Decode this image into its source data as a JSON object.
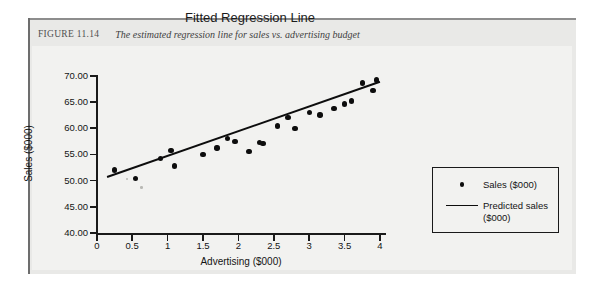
{
  "figure": {
    "label": "FIGURE 11.14",
    "caption": "The estimated regression line for sales vs. advertising budget"
  },
  "colors": {
    "ink": "#0d0d0d",
    "page_panel": "#e9e9e7",
    "chart_background": "#f2f2f0",
    "caption_text": "#4a4a4a"
  },
  "legend": {
    "series_label": "Sales ($000)",
    "line_label": "Predicted sales\n($000)",
    "position": "right-outside"
  },
  "chart_data": {
    "type": "scatter",
    "title": "Fitted Regression Line",
    "xlabel": "Advertising ($000)",
    "ylabel": "Sales ($000)",
    "xlim": [
      0,
      4
    ],
    "ylim": [
      40.0,
      70.0
    ],
    "xticks": [
      "0",
      "0.5",
      "1",
      "1.5",
      "2",
      "2.5",
      "3",
      "3.5",
      "4"
    ],
    "xtick_values": [
      0,
      0.5,
      1,
      1.5,
      2,
      2.5,
      3,
      3.5,
      4
    ],
    "yticks": [
      "40.00",
      "45.00",
      "50.00",
      "55.00",
      "60.00",
      "65.00",
      "70.00"
    ],
    "ytick_values": [
      40.0,
      45.0,
      50.0,
      55.0,
      60.0,
      65.0,
      70.0
    ],
    "grid": false,
    "series": [
      {
        "name": "Sales ($000)",
        "type": "scatter",
        "marker": "filled-circle",
        "points": [
          {
            "x": 0.25,
            "y": 52.0
          },
          {
            "x": 0.55,
            "y": 50.4
          },
          {
            "x": 0.9,
            "y": 54.2
          },
          {
            "x": 1.05,
            "y": 55.8
          },
          {
            "x": 1.1,
            "y": 52.8
          },
          {
            "x": 1.5,
            "y": 55.0
          },
          {
            "x": 1.7,
            "y": 56.2
          },
          {
            "x": 1.85,
            "y": 58.0
          },
          {
            "x": 1.95,
            "y": 57.5
          },
          {
            "x": 2.15,
            "y": 55.6
          },
          {
            "x": 2.3,
            "y": 57.3
          },
          {
            "x": 2.35,
            "y": 57.1
          },
          {
            "x": 2.55,
            "y": 60.4
          },
          {
            "x": 2.7,
            "y": 62.0
          },
          {
            "x": 2.8,
            "y": 59.9
          },
          {
            "x": 3.0,
            "y": 63.0
          },
          {
            "x": 3.15,
            "y": 62.5
          },
          {
            "x": 3.35,
            "y": 63.8
          },
          {
            "x": 3.5,
            "y": 64.6
          },
          {
            "x": 3.6,
            "y": 65.2
          },
          {
            "x": 3.75,
            "y": 68.6
          },
          {
            "x": 3.95,
            "y": 69.2
          },
          {
            "x": 3.9,
            "y": 67.2
          }
        ]
      },
      {
        "name": "Predicted sales ($000)",
        "type": "line",
        "endpoints": [
          {
            "x": 0.14,
            "y": 50.7
          },
          {
            "x": 4.0,
            "y": 68.9
          }
        ]
      }
    ]
  }
}
